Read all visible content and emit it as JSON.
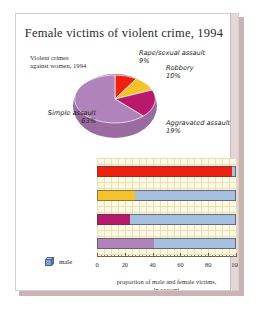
{
  "figure": {
    "title": "Female victims of violent crime, 1994"
  },
  "pie": {
    "caption": "Violent crimes\nagainst women, 1994",
    "labels": {
      "rape": {
        "name": "Rape/sexual assault",
        "value": "9%"
      },
      "robbery": {
        "name": "Robbery",
        "value": "10%"
      },
      "aggravated": {
        "name": "Aggravated assault",
        "value": "19%"
      },
      "simple": {
        "name": "Simple assault",
        "value": "63%"
      }
    }
  },
  "legend": {
    "male_label": "male",
    "male_icon": "blue-cube-icon"
  },
  "axis": {
    "caption_line1": "proportion of male and female victims,",
    "caption_line2": "in percent",
    "ticks": [
      "0",
      "20",
      "40",
      "60",
      "80",
      "100"
    ]
  },
  "bar_labels": {
    "rape": "Rape/sexual assault",
    "robbery": "Robbery",
    "aggravated": "Aggravated assault",
    "simple": "Simple assault"
  },
  "colors": {
    "rape": "#ee2111",
    "robbery": "#f6c22b",
    "aggravated": "#b8196b",
    "simple": "#b084ba",
    "male": "#a8c0e0",
    "plot_bg": "#fdf9e3"
  },
  "chart_data": [
    {
      "type": "pie",
      "title": "Violent crimes against women, 1994",
      "labels": [
        "Rape/sexual assault",
        "Robbery",
        "Aggravated assault",
        "Simple assault"
      ],
      "values": [
        9,
        10,
        19,
        63
      ],
      "colors": [
        "#ee2111",
        "#f6c22b",
        "#b8196b",
        "#b084ba"
      ],
      "legend": "inline-labels"
    },
    {
      "type": "bar",
      "orientation": "horizontal",
      "stacked": true,
      "categories": [
        "Rape/sexual assault",
        "Robbery",
        "Aggravated assault",
        "Simple assault"
      ],
      "series": [
        {
          "name": "female",
          "values": [
            97,
            27,
            24,
            41
          ],
          "colors": [
            "#ee2111",
            "#f6c22b",
            "#b8196b",
            "#b084ba"
          ]
        },
        {
          "name": "male",
          "values": [
            3,
            73,
            76,
            59
          ],
          "color": "#a8c0e0"
        }
      ],
      "xlabel": "proportion of male and female victims, in percent",
      "ylabel": "",
      "xlim": [
        0,
        100
      ],
      "xticks": [
        0,
        20,
        40,
        60,
        80,
        100
      ],
      "grid": true,
      "legend_position": "bottom-left",
      "legend_entries": [
        "male"
      ]
    }
  ]
}
